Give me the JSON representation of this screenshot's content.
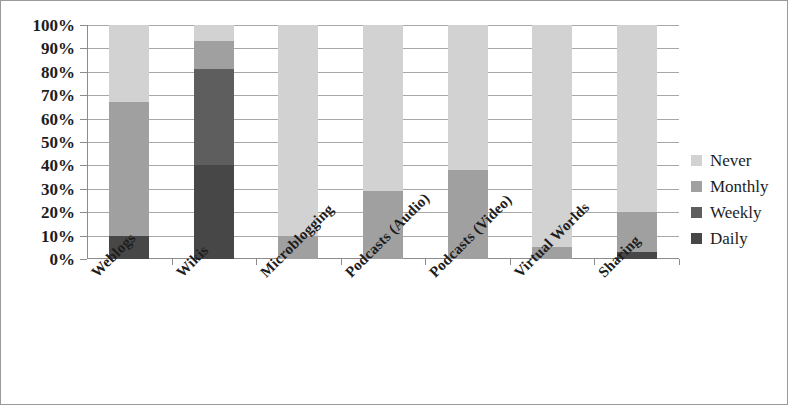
{
  "chart_data": {
    "type": "bar",
    "subtype": "stacked-100-percent",
    "title": "",
    "subtitle": "",
    "xlabel": "",
    "ylabel": "",
    "ylim": [
      0,
      100
    ],
    "grid": true,
    "legend_position": "right",
    "categories": [
      "Weblogs",
      "Wikis",
      "Microblogging",
      "Podcasts (Audio)",
      "Podcasts (Video)",
      "Virtual Worlds",
      "Sharing"
    ],
    "ytick_labels": [
      "0%",
      "10%",
      "20%",
      "30%",
      "40%",
      "50%",
      "60%",
      "70%",
      "80%",
      "90%",
      "100%"
    ],
    "ytick_values": [
      0,
      10,
      20,
      30,
      40,
      50,
      60,
      70,
      80,
      90,
      100
    ],
    "series": [
      {
        "name": "Daily",
        "color": "#474747",
        "values": [
          10,
          40,
          0,
          0,
          0,
          0,
          3
        ]
      },
      {
        "name": "Weekly",
        "color": "#5e5e5e",
        "values": [
          0,
          41,
          0,
          0,
          0,
          0,
          0
        ]
      },
      {
        "name": "Monthly",
        "color": "#a0a0a0",
        "values": [
          57,
          12,
          10,
          29,
          38,
          5,
          17
        ]
      },
      {
        "name": "Never",
        "color": "#d2d2d2",
        "values": [
          33,
          7,
          90,
          71,
          62,
          95,
          80
        ]
      }
    ],
    "legend": [
      {
        "label": "Never",
        "color": "#d2d2d2"
      },
      {
        "label": "Monthly",
        "color": "#a0a0a0"
      },
      {
        "label": "Weekly",
        "color": "#5e5e5e"
      },
      {
        "label": "Daily",
        "color": "#474747"
      }
    ],
    "axis_color": "#8c8c8c",
    "gridline_color": "#a8a8a8",
    "border_color": "#9a9a9a",
    "background": "#ffffff"
  }
}
